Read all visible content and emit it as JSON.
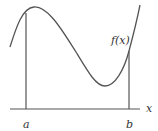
{
  "diagram": {
    "function_label": "f(x)",
    "x_axis_label": "x",
    "lower_bound_label": "a",
    "upper_bound_label": "b",
    "colors": {
      "stroke": "#555555",
      "text": "#333333",
      "background": "#ffffff"
    }
  }
}
